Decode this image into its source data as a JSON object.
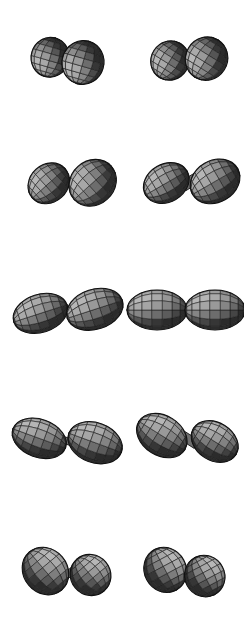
{
  "figure": {
    "background_color": "#ffffff",
    "width": 244,
    "height": 640,
    "rows": 5,
    "columns": 2,
    "render_style": "shaded wireframe mesh surface",
    "mesh_color": "#1c1c1c",
    "surface_light": "#b8b8b8",
    "surface_mid": "#6e6e6e",
    "surface_dark": "#2b2b2b",
    "outline_color": "#111111"
  },
  "panels": [
    {
      "id": "panel-r1c1",
      "row": 1,
      "column": 1,
      "label": "row-1-left",
      "center_x": 67,
      "center_y": 60,
      "tilt_deg": -74,
      "neck_radius": 0.68,
      "lobe_elongation": 1.02,
      "lobe_a": {
        "cx": -2,
        "cy": -17,
        "rx": 20,
        "ry": 19,
        "rot": -74
      },
      "lobe_b": {
        "cx": 2,
        "cy": 16,
        "rx": 22,
        "ry": 21,
        "rot": -74
      },
      "description": "two near-spherical lobes stacked vertically, slight tilt"
    },
    {
      "id": "panel-r1c2",
      "row": 1,
      "column": 2,
      "label": "row-1-right",
      "center_x": 188,
      "center_y": 60,
      "tilt_deg": -58,
      "neck_radius": 0.68,
      "lobe_elongation": 1.03,
      "lobe_a": {
        "cx": -10,
        "cy": -15,
        "rx": 20,
        "ry": 19,
        "rot": -58
      },
      "lobe_b": {
        "cx": 11,
        "cy": 15,
        "rx": 22,
        "ry": 21,
        "rot": -58
      },
      "description": "two near-spherical lobes, tilted about 58 degrees"
    },
    {
      "id": "panel-r2c1",
      "row": 2,
      "column": 1,
      "label": "row-2-left",
      "center_x": 70,
      "center_y": 183,
      "tilt_deg": -42,
      "neck_radius": 0.42,
      "lobe_elongation": 1.16,
      "lobe_a": {
        "cx": -16,
        "cy": -14,
        "rx": 22,
        "ry": 19,
        "rot": -42
      },
      "lobe_b": {
        "cx": 17,
        "cy": 15,
        "rx": 25,
        "ry": 22,
        "rot": -42
      },
      "description": "two rounded lobes with narrowing neck, tilted down-right"
    },
    {
      "id": "panel-r2c2",
      "row": 2,
      "column": 2,
      "label": "row-2-right",
      "center_x": 190,
      "center_y": 182,
      "tilt_deg": -30,
      "neck_radius": 0.3,
      "lobe_elongation": 1.24,
      "lobe_a": {
        "cx": -21,
        "cy": -11,
        "rx": 24,
        "ry": 19,
        "rot": -30
      },
      "lobe_b": {
        "cx": 22,
        "cy": 12,
        "rx": 26,
        "ry": 21,
        "rot": -30
      },
      "description": "two ovoid lobes with thin neck, tilted down-right"
    },
    {
      "id": "panel-r3c1",
      "row": 3,
      "column": 1,
      "label": "row-3-left",
      "center_x": 67,
      "center_y": 311,
      "tilt_deg": -18,
      "neck_radius": 0.18,
      "lobe_elongation": 1.46,
      "lobe_a": {
        "cx": -26,
        "cy": -6,
        "rx": 28,
        "ry": 19,
        "rot": -18
      },
      "lobe_b": {
        "cx": 27,
        "cy": 7,
        "rx": 29,
        "ry": 20,
        "rot": -18
      },
      "description": "two almond lobes nearly horizontal, very thin neck"
    },
    {
      "id": "panel-r3c2",
      "row": 3,
      "column": 2,
      "label": "row-3-right",
      "center_x": 186,
      "center_y": 310,
      "tilt_deg": 0,
      "neck_radius": 0.14,
      "lobe_elongation": 1.52,
      "lobe_a": {
        "cx": -29,
        "cy": 0,
        "rx": 30,
        "ry": 20,
        "rot": 0
      },
      "lobe_b": {
        "cx": 29,
        "cy": 0,
        "rx": 30,
        "ry": 20,
        "rot": 0
      },
      "description": "symmetric scission point, two lemon lobes, fully horizontal"
    },
    {
      "id": "panel-r4c1",
      "row": 4,
      "column": 1,
      "label": "row-4-left",
      "center_x": 67,
      "center_y": 441,
      "tilt_deg": 20,
      "neck_radius": 0.18,
      "lobe_elongation": 1.44,
      "lobe_a": {
        "cx": -27,
        "cy": 7,
        "rx": 28,
        "ry": 19,
        "rot": 20
      },
      "lobe_b": {
        "cx": 27,
        "cy": -8,
        "rx": 28,
        "ry": 20,
        "rot": 20
      },
      "description": "two almond lobes tilted up-right, thin neck"
    },
    {
      "id": "panel-r4c2",
      "row": 4,
      "column": 2,
      "label": "row-4-right",
      "center_x": 188,
      "center_y": 439,
      "tilt_deg": 32,
      "neck_radius": 0.26,
      "lobe_elongation": 1.3,
      "lobe_a": {
        "cx": -24,
        "cy": 11,
        "rx": 27,
        "ry": 20,
        "rot": 32
      },
      "lobe_b": {
        "cx": 24,
        "cy": -12,
        "rx": 25,
        "ry": 19,
        "rot": 32
      },
      "description": "two ovoid lobes tilted up-right"
    },
    {
      "id": "panel-r5c1",
      "row": 5,
      "column": 1,
      "label": "row-5-left",
      "center_x": 68,
      "center_y": 573,
      "tilt_deg": 50,
      "neck_radius": 0.5,
      "lobe_elongation": 1.14,
      "lobe_a": {
        "cx": -16,
        "cy": 16,
        "rx": 25,
        "ry": 22,
        "rot": 50
      },
      "lobe_b": {
        "cx": 16,
        "cy": -16,
        "rx": 21,
        "ry": 20,
        "rot": 50
      },
      "description": "large lower-left lobe and smaller upper-right lobe"
    },
    {
      "id": "panel-r5c2",
      "row": 5,
      "column": 2,
      "label": "row-5-right",
      "center_x": 185,
      "center_y": 573,
      "tilt_deg": 62,
      "neck_radius": 0.62,
      "lobe_elongation": 1.06,
      "lobe_a": {
        "cx": -12,
        "cy": 16,
        "rx": 23,
        "ry": 21,
        "rot": 62
      },
      "lobe_b": {
        "cx": 12,
        "cy": -16,
        "rx": 21,
        "ry": 20,
        "rot": 62
      },
      "description": "two near-spherical lobes stacked diagonally"
    }
  ]
}
